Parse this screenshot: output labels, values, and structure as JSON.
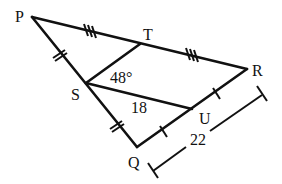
{
  "diagram": {
    "type": "geometry-figure",
    "vertices": {
      "P": {
        "label": "P"
      },
      "T": {
        "label": "T"
      },
      "R": {
        "label": "R"
      },
      "S": {
        "label": "S"
      },
      "U": {
        "label": "U"
      },
      "Q": {
        "label": "Q"
      }
    },
    "segments": [
      "PR",
      "PQ",
      "QR",
      "ST",
      "SU"
    ],
    "congruence_marks": {
      "PT_TR": "triple tick",
      "PS_SQ": "double tick",
      "QU_UR": "single tick"
    },
    "annotations": {
      "angle_TSU": "48°",
      "SU_length": "18",
      "QR_length": "22"
    }
  }
}
